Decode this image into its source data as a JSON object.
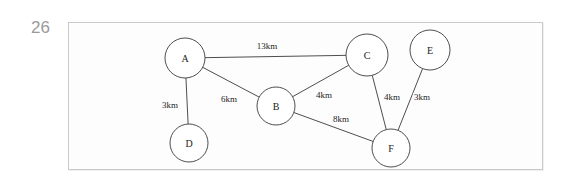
{
  "question_number": "26",
  "figure": {
    "title": "",
    "border_color": "#c9c9c9",
    "background_color": "#fdfdfd"
  },
  "chart_data": {
    "type": "diagram",
    "diagram_kind": "weighted-undirected-graph",
    "title": "",
    "edge_unit": "km",
    "node_color": "#ffffff",
    "stroke_color": "#3a3a3a",
    "nodes": [
      {
        "id": "A",
        "label": "A",
        "cx": 185,
        "cy": 58,
        "r": 20
      },
      {
        "id": "B",
        "label": "B",
        "cx": 276,
        "cy": 106,
        "r": 19
      },
      {
        "id": "C",
        "label": "C",
        "cx": 367,
        "cy": 55,
        "r": 21
      },
      {
        "id": "D",
        "label": "D",
        "cx": 189,
        "cy": 143,
        "r": 19
      },
      {
        "id": "E",
        "label": "E",
        "cx": 430,
        "cy": 50,
        "r": 20
      },
      {
        "id": "F",
        "label": "F",
        "cx": 391,
        "cy": 148,
        "r": 19
      }
    ],
    "edges": [
      {
        "from": "A",
        "to": "C",
        "weight": 13,
        "label": "13km",
        "lx": 267,
        "ly": 46
      },
      {
        "from": "A",
        "to": "D",
        "weight": 3,
        "label": "3km",
        "lx": 170,
        "ly": 105
      },
      {
        "from": "A",
        "to": "B",
        "weight": 6,
        "label": "6km",
        "lx": 229,
        "ly": 99
      },
      {
        "from": "B",
        "to": "C",
        "weight": 4,
        "label": "4km",
        "lx": 324,
        "ly": 95
      },
      {
        "from": "B",
        "to": "F",
        "weight": 8,
        "label": "8km",
        "lx": 341,
        "ly": 119
      },
      {
        "from": "C",
        "to": "F",
        "weight": 4,
        "label": "4km",
        "lx": 392,
        "ly": 97
      },
      {
        "from": "E",
        "to": "F",
        "weight": 3,
        "label": "3km",
        "lx": 422,
        "ly": 97
      }
    ]
  }
}
